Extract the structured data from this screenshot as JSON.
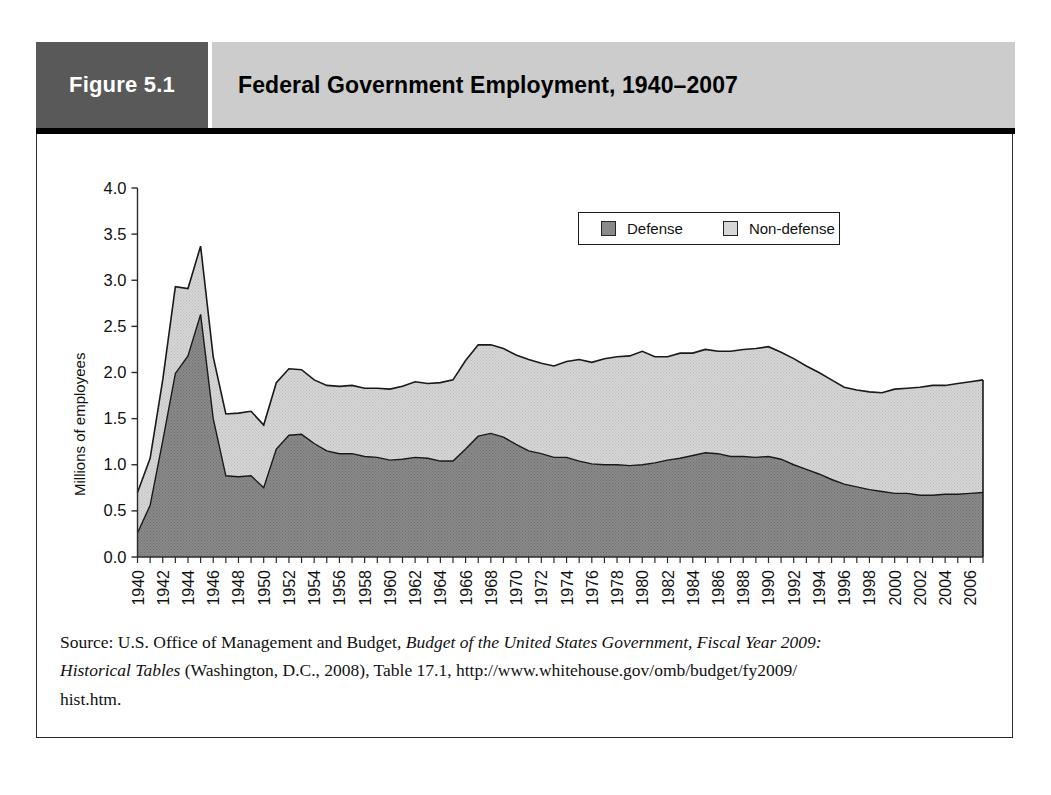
{
  "figure": {
    "label": "Figure 5.1",
    "title": "Federal Government Employment, 1940–2007"
  },
  "legend": {
    "position": "top-center",
    "items": [
      {
        "label": "Defense",
        "color": "#8a8a8a",
        "icon": "legend-swatch"
      },
      {
        "label": "Non-defense",
        "color": "#d6d6d6",
        "icon": "legend-swatch"
      }
    ]
  },
  "axes": {
    "ylabel": "Millions of employees",
    "yticks": [
      "0.0",
      "0.5",
      "1.0",
      "1.5",
      "2.0",
      "2.5",
      "3.0",
      "3.5",
      "4.0"
    ],
    "xticks": [
      "1940",
      "1942",
      "1944",
      "1946",
      "1948",
      "1950",
      "1952",
      "1954",
      "1956",
      "1958",
      "1960",
      "1962",
      "1964",
      "1966",
      "1968",
      "1970",
      "1972",
      "1974",
      "1976",
      "1978",
      "1980",
      "1982",
      "1984",
      "1986",
      "1988",
      "1990",
      "1992",
      "1994",
      "1996",
      "1998",
      "2000",
      "2002",
      "2004",
      "2006"
    ]
  },
  "source": {
    "line1_a": "Source: U.S. Office of Management and Budget, ",
    "line1_i": "Budget of the United States Government, Fiscal Year 2009:",
    "line2_i": "Historical Tables",
    "line2_a": " (Washington, D.C., 2008), Table 17.1, http://www.whitehouse.gov/omb/budget/fy2009/",
    "line3": "hist.htm."
  },
  "colors": {
    "header_label_bg": "#595959",
    "header_title_bg": "#cccccc",
    "defense": "#8a8a8a",
    "nondefense": "#d6d6d6",
    "outline": "#1c1c1c"
  },
  "chart_data": {
    "type": "area",
    "stacked": true,
    "title": "Federal Government Employment, 1940–2007",
    "xlabel": "",
    "ylabel": "Millions of employees",
    "ylim": [
      0.0,
      4.0
    ],
    "xlim": [
      1940,
      2007
    ],
    "grid": false,
    "legend_position": "top-center",
    "x": [
      1940,
      1941,
      1942,
      1943,
      1944,
      1945,
      1946,
      1947,
      1948,
      1949,
      1950,
      1951,
      1952,
      1953,
      1954,
      1955,
      1956,
      1957,
      1958,
      1959,
      1960,
      1961,
      1962,
      1963,
      1964,
      1965,
      1966,
      1967,
      1968,
      1969,
      1970,
      1971,
      1972,
      1973,
      1974,
      1975,
      1976,
      1977,
      1978,
      1979,
      1980,
      1981,
      1982,
      1983,
      1984,
      1985,
      1986,
      1987,
      1988,
      1989,
      1990,
      1991,
      1992,
      1993,
      1994,
      1995,
      1996,
      1997,
      1998,
      1999,
      2000,
      2001,
      2002,
      2003,
      2004,
      2005,
      2006,
      2007
    ],
    "series": [
      {
        "name": "Defense",
        "color": "#8a8a8a",
        "values": [
          0.26,
          0.56,
          1.26,
          1.99,
          2.18,
          2.63,
          1.5,
          0.88,
          0.87,
          0.88,
          0.75,
          1.17,
          1.32,
          1.33,
          1.23,
          1.15,
          1.12,
          1.12,
          1.09,
          1.08,
          1.05,
          1.06,
          1.08,
          1.07,
          1.04,
          1.04,
          1.17,
          1.31,
          1.34,
          1.3,
          1.22,
          1.15,
          1.12,
          1.08,
          1.08,
          1.04,
          1.01,
          1.0,
          1.0,
          0.99,
          1.0,
          1.02,
          1.05,
          1.07,
          1.1,
          1.13,
          1.12,
          1.09,
          1.09,
          1.08,
          1.09,
          1.06,
          1.0,
          0.95,
          0.9,
          0.84,
          0.79,
          0.76,
          0.73,
          0.71,
          0.69,
          0.69,
          0.67,
          0.67,
          0.68,
          0.68,
          0.69,
          0.7
        ]
      },
      {
        "name": "Non-defense",
        "color": "#d6d6d6",
        "values": [
          0.44,
          0.51,
          0.66,
          0.94,
          0.73,
          0.74,
          0.67,
          0.67,
          0.69,
          0.7,
          0.68,
          0.72,
          0.72,
          0.7,
          0.69,
          0.71,
          0.73,
          0.74,
          0.74,
          0.75,
          0.77,
          0.79,
          0.82,
          0.81,
          0.85,
          0.88,
          0.96,
          0.99,
          0.96,
          0.96,
          0.97,
          0.99,
          0.98,
          0.99,
          1.04,
          1.1,
          1.1,
          1.15,
          1.17,
          1.19,
          1.23,
          1.15,
          1.12,
          1.14,
          1.11,
          1.12,
          1.11,
          1.14,
          1.16,
          1.18,
          1.19,
          1.16,
          1.15,
          1.12,
          1.1,
          1.08,
          1.05,
          1.05,
          1.06,
          1.07,
          1.13,
          1.14,
          1.17,
          1.19,
          1.18,
          1.2,
          1.21,
          1.22
        ]
      }
    ]
  }
}
